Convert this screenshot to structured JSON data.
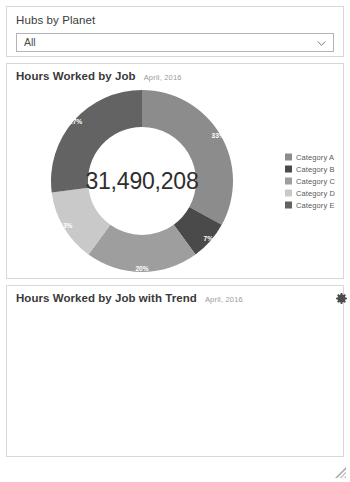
{
  "filter": {
    "label": "Hubs by Planet",
    "selected": "All",
    "chevron_icon": "chevron-down-icon"
  },
  "donut_panel": {
    "title": "Hours Worked by Job",
    "subtitle": "April, 2016",
    "center_value": "31,490,208"
  },
  "trend_panel": {
    "title": "Hours Worked by Job with Trend",
    "subtitle": "April, 2016"
  },
  "controls": {
    "gear_icon": "gear-icon",
    "resize_icon": "resize-grip-icon"
  },
  "colors": {
    "category_a": "#8c8c8c",
    "category_b": "#4a4a4a",
    "category_c": "#9e9e9e",
    "category_d": "#c9c9c9",
    "category_e": "#636363",
    "panel_border": "#d8d8d8",
    "label_text": "#ffffff"
  },
  "chart_data": {
    "type": "pie",
    "title": "Hours Worked by Job",
    "subtitle": "April, 2016",
    "center_label": "31,490,208",
    "center_value": 31490208,
    "donut": true,
    "legend_position": "right",
    "categories": [
      "Category A",
      "Category B",
      "Category C",
      "Category D",
      "Category E"
    ],
    "values": [
      33,
      7,
      20,
      13,
      27
    ],
    "value_labels": [
      "33%",
      "7%",
      "20%",
      "13%",
      "27%"
    ],
    "unit": "percent",
    "colors": [
      "#8c8c8c",
      "#4a4a4a",
      "#9e9e9e",
      "#c9c9c9",
      "#636363"
    ],
    "slices": [
      {
        "label": "Category A",
        "value": 33,
        "display": "33%",
        "color": "#8c8c8c"
      },
      {
        "label": "Category B",
        "value": 7,
        "display": "7%",
        "color": "#4a4a4a"
      },
      {
        "label": "Category C",
        "value": 20,
        "display": "20%",
        "color": "#9e9e9e"
      },
      {
        "label": "Category D",
        "value": 13,
        "display": "13%",
        "color": "#c9c9c9"
      },
      {
        "label": "Category E",
        "value": 27,
        "display": "27%",
        "color": "#636363"
      }
    ]
  }
}
